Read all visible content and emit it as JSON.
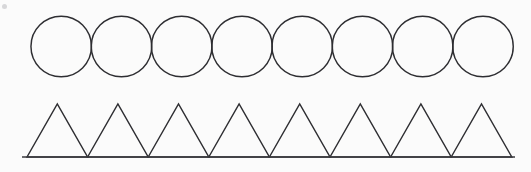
{
  "figure": {
    "background_color": "#fdfdfd",
    "stroke_color": "#2e2e32",
    "stroke_width": 1.45,
    "canvas": {
      "width": 531,
      "height": 172
    },
    "rows": [
      {
        "id": "circle-row",
        "label": "Row of circles",
        "shape": "circle",
        "count": 8,
        "diameter": 60.5,
        "center_y": 46.5,
        "top_y": 16,
        "bottom_y": 77,
        "start_x": 31,
        "end_x": 513,
        "spacing": 60.25,
        "centers_x": [
          61.2,
          121.5,
          181.7,
          242.0,
          302.2,
          362.5,
          422.7,
          483.0
        ],
        "tangent": "true"
      },
      {
        "id": "triangle-row",
        "label": "Row of triangles",
        "shape": "triangle",
        "count": 8,
        "base_width": 60.6,
        "height": 53,
        "apex_y": 104,
        "base_y": 157,
        "start_x": 27,
        "end_x": 512,
        "bases_left_x": [
          27.0,
          87.6,
          148.2,
          208.8,
          269.4,
          330.0,
          390.6,
          451.2
        ],
        "apexes_x": [
          57.3,
          117.9,
          178.5,
          239.1,
          299.7,
          360.3,
          420.9,
          481.5
        ],
        "shares_baseline": "true"
      }
    ],
    "baseline": {
      "id": "shared-baseline",
      "label": "Shared horizontal baseline under triangles",
      "x1": 22,
      "x2": 515,
      "y": 157,
      "color": "#3a3a3e"
    },
    "artifacts": [
      {
        "id": "speck-top-left",
        "x": 2,
        "y": 4,
        "width": 5,
        "height": 5
      }
    ]
  },
  "chart_data": {
    "type": "table",
    "xlabel": "",
    "ylabel": "",
    "categories": [
      "circle-row",
      "triangle-row"
    ],
    "series": [
      {
        "name": "shape count",
        "values": [
          8,
          8
        ]
      },
      {
        "name": "shape width (px)",
        "values": [
          60.5,
          60.6
        ]
      },
      {
        "name": "shape height (px)",
        "values": [
          60.5,
          53
        ]
      }
    ]
  }
}
